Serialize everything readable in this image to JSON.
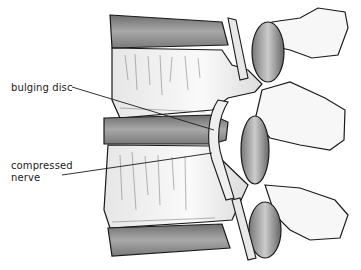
{
  "figure": {
    "labels": [
      {
        "id": "bulging-disc",
        "text": "bulging disc"
      },
      {
        "id": "compressed-nerve",
        "line1": "compressed",
        "line2": "nerve"
      }
    ],
    "colors": {
      "ink": "#1a1a1a",
      "disc_shade": "#8a8a8a",
      "bone": "#f4f4f4",
      "background": "#ffffff"
    }
  }
}
